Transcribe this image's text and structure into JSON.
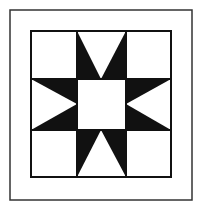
{
  "diagram": {
    "title": "",
    "colors": {
      "background": "#ffffff",
      "ink": "#111111",
      "frame": "#333333"
    },
    "frame": {
      "x": 10,
      "y": 10,
      "width": 182,
      "height": 190
    },
    "block": {
      "x": 31,
      "y": 31,
      "width": 140,
      "height": 146
    },
    "grid": {
      "cols": [
        31,
        77,
        126,
        171
      ],
      "rows": [
        31,
        79,
        130,
        177
      ]
    },
    "star_points": [
      "top",
      "right",
      "bottom",
      "left"
    ]
  }
}
